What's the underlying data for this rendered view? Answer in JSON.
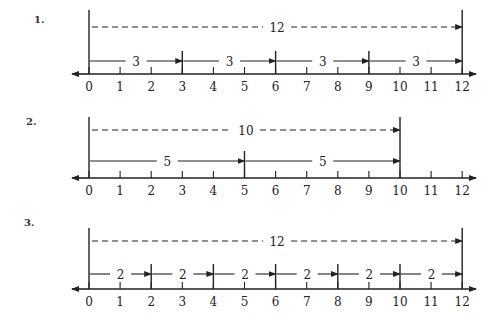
{
  "diagrams": [
    {
      "label": "1.",
      "label_pos": [
        34,
        14
      ],
      "axis_y": 74,
      "top_y": 10,
      "dashed_y": 27,
      "solid_y": 61,
      "end_value": 12,
      "step": 3,
      "dashed_label": "12",
      "segment_label": "3"
    },
    {
      "label": "2.",
      "label_pos": [
        26,
        116
      ],
      "axis_y": 178,
      "top_y": 117,
      "dashed_y": 130,
      "solid_y": 161,
      "end_value": 10,
      "step": 5,
      "dashed_label": "10",
      "segment_label": "5"
    },
    {
      "label": "3.",
      "label_pos": [
        24,
        217
      ],
      "axis_y": 289,
      "top_y": 228,
      "dashed_y": 241,
      "solid_y": 274,
      "end_value": 12,
      "step": 2,
      "dashed_label": "12",
      "segment_label": "2"
    }
  ],
  "axis": {
    "min": 0,
    "max": 12,
    "tick_labels": [
      "0",
      "1",
      "2",
      "3",
      "4",
      "5",
      "6",
      "7",
      "8",
      "9",
      "10",
      "11",
      "12"
    ],
    "x0": 89,
    "unit_px": 31.1,
    "left_arrow_x": 72,
    "right_arrow_x": 476
  }
}
